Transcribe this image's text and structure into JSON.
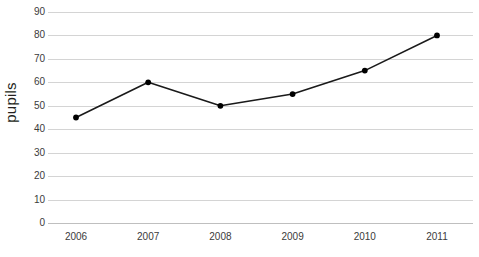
{
  "chart_data": {
    "type": "line",
    "title": "",
    "xlabel": "",
    "ylabel": "pupils",
    "categories": [
      "2006",
      "2007",
      "2008",
      "2009",
      "2010",
      "2011"
    ],
    "values": [
      45,
      60,
      50,
      55,
      65,
      80
    ],
    "series": [
      {
        "name": "pupils",
        "values": [
          45,
          60,
          50,
          55,
          65,
          80
        ]
      }
    ],
    "ylim": [
      0,
      90
    ],
    "ytick_step": 10,
    "ytick_labels": [
      "0",
      "10",
      "20",
      "30",
      "40",
      "50",
      "60",
      "70",
      "80",
      "90"
    ],
    "grid": true,
    "grid_axis": "y",
    "legend": false,
    "legend_position": "none",
    "marker": "circle",
    "line_color": "#1a1a1a",
    "marker_color": "#000000",
    "grid_color": "#d4d4d4",
    "background_color": "#ffffff",
    "text_color": "#3b3b3b"
  }
}
